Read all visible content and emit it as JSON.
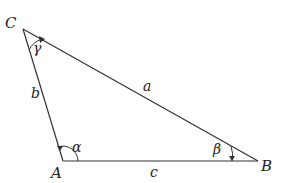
{
  "diagram": {
    "type": "triangle",
    "vertices": {
      "A": {
        "label": "A",
        "x": 63,
        "y": 161
      },
      "B": {
        "label": "B",
        "x": 258,
        "y": 161
      },
      "C": {
        "label": "C",
        "x": 23,
        "y": 29
      }
    },
    "sides": {
      "a": {
        "label": "a",
        "between": [
          "B",
          "C"
        ]
      },
      "b": {
        "label": "b",
        "between": [
          "A",
          "C"
        ]
      },
      "c": {
        "label": "c",
        "between": [
          "A",
          "B"
        ]
      }
    },
    "angles": {
      "alpha": {
        "label": "α",
        "at": "A"
      },
      "beta": {
        "label": "β",
        "at": "B"
      },
      "gamma": {
        "label": "γ",
        "at": "C"
      }
    },
    "colors": {
      "stroke": "#333333",
      "text": "#222222",
      "background": "#ffffff"
    }
  }
}
